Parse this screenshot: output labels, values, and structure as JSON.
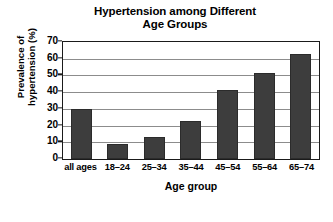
{
  "chart_data": {
    "type": "bar",
    "title": "Hypertension among Different Age Groups",
    "title_lines": [
      "Hypertension among Different",
      "Age Groups"
    ],
    "categories": [
      "all ages",
      "18–24",
      "25–34",
      "35–44",
      "45–54",
      "55–64",
      "65–74"
    ],
    "values": [
      30,
      9,
      13,
      22.5,
      41,
      51.5,
      63
    ],
    "xlabel": "Age group",
    "ylabel": "Prevalence of hypertension (%)",
    "ylabel_lines": [
      "Prevalence of",
      "hypertension (%)"
    ],
    "ylim": [
      0,
      70
    ],
    "yticks": [
      0,
      10,
      20,
      30,
      40,
      50,
      60,
      70
    ],
    "ytick_labels": [
      "0",
      "10",
      "20",
      "30",
      "40",
      "50",
      "60",
      "70"
    ],
    "grid": true,
    "grid_axis": "y",
    "legend": false,
    "bar_color": "#3d3d3d",
    "grid_color": "#8c8c8c",
    "axis_color": "#1a1a1a",
    "background_color": "#ffffff"
  }
}
